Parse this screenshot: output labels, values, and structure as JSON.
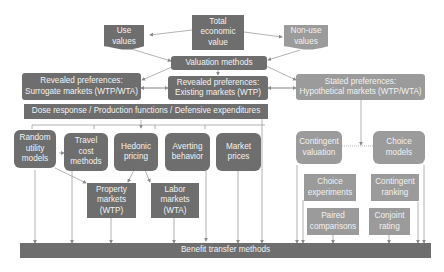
{
  "diagram": {
    "top": {
      "total_economic_value": "Total\neconomic\nvalue",
      "use_values": "Use\nvalues",
      "non_use_values": "Non-use\nvalues",
      "valuation_methods": "Valuation methods"
    },
    "preferences": {
      "revealed_surrogate": "Revealed preferences:\nSurrogate markets (WTP/WTA)",
      "revealed_existing": "Revealed preferences:\nExisting  markets (WTP)",
      "stated": "Stated preferences:\nHypothetical markets (WTP/WTA)"
    },
    "dose_response": "Dose response / Production functions / Defensive expenditures",
    "revealed_methods": [
      {
        "label": "Random\nutility\nmodels"
      },
      {
        "label": "Travel\ncost\nmethods"
      },
      {
        "label": "Hedonic\npricing"
      },
      {
        "label": "Averting\nbehavior"
      },
      {
        "label": "Market\nprices"
      }
    ],
    "hedonic_sub": [
      {
        "label": "Property\nmarkets\n(WTP)"
      },
      {
        "label": "Labor\nmarkets\n(WTA)"
      }
    ],
    "stated_methods": [
      {
        "label": "Contingent\nvaluation"
      },
      {
        "label": "Choice\nmodels"
      }
    ],
    "choice_sub": [
      {
        "label": "Choice\nexperiments"
      },
      {
        "label": "Contingent\nranking"
      },
      {
        "label": "Paired\ncomparisons"
      },
      {
        "label": "Conjoint\nrating"
      }
    ],
    "benefit_transfer": "Benefit transfer methods"
  },
  "colors": {
    "dark_box": "#6e6e6e",
    "light_box": "#9b9b9b",
    "line": "#a0a0a0",
    "text": "#f2f2f2"
  }
}
